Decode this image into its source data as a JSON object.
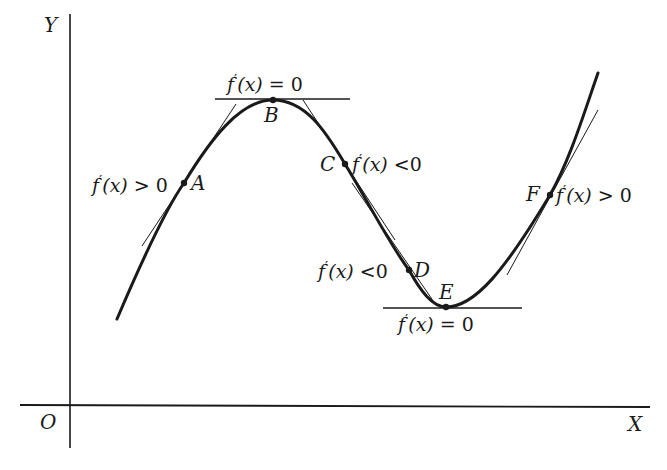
{
  "figure": {
    "axes": {
      "y_label": "Y",
      "x_label": "X",
      "origin_label": "O"
    },
    "colors": {
      "ink": "#1a1a1a",
      "background": "#ffffff"
    },
    "points": [
      {
        "name": "A",
        "annotation": "f′(x) > 0",
        "description": "rising part of curve, positive slope"
      },
      {
        "name": "B",
        "annotation": "f′(x) = 0",
        "description": "local maximum, horizontal tangent"
      },
      {
        "name": "C",
        "annotation": "f′(x) < 0",
        "description": "falling part of curve, negative slope"
      },
      {
        "name": "D",
        "annotation": "f′(x) < 0",
        "description": "falling part of curve, negative slope"
      },
      {
        "name": "E",
        "annotation": "f′(x) = 0",
        "description": "local minimum, horizontal tangent"
      },
      {
        "name": "F",
        "annotation": "f′(x) > 0",
        "description": "rising part of curve, positive slope"
      }
    ],
    "labels": {
      "A": "A",
      "B": "B",
      "C": "C",
      "D": "D",
      "E": "E",
      "F": "F",
      "ann_A": {
        "f": "f",
        "prime": "′",
        "arg": "(x)",
        "rel": " > 0"
      },
      "ann_B": {
        "f": "f",
        "prime": "′",
        "arg": "(x)",
        "rel": " = 0"
      },
      "ann_C": {
        "f": "f",
        "prime": "′",
        "arg": "(x)",
        "rel": " <0"
      },
      "ann_D": {
        "f": "f",
        "prime": "′",
        "arg": "(x)",
        "rel": " <0"
      },
      "ann_E": {
        "f": "f",
        "prime": "′",
        "arg": "(x)",
        "rel": " = 0"
      },
      "ann_F": {
        "f": "f",
        "prime": "′",
        "arg": "(x)",
        "rel": " > 0"
      }
    }
  }
}
